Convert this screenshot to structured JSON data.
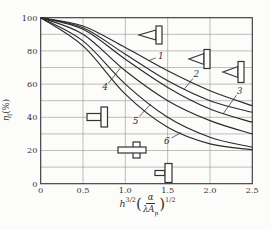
{
  "axes": {
    "y_symbol": "η",
    "y_sub": "f",
    "y_unit": "(%)",
    "x_base": "h",
    "x_base_exp": "3/2",
    "x_lparen": "(",
    "x_num": "α",
    "x_den_lambda": "λ",
    "x_den_A": "A",
    "x_den_sub": "p",
    "x_rparen": ")",
    "x_outer_exp": "1/2"
  },
  "chart_data": {
    "type": "line",
    "title": "",
    "xlabel": "h^(3/2)·(α/(λ·A_p))^(1/2)",
    "ylabel": "η_f (%)",
    "xlim": [
      0,
      2.5
    ],
    "ylim": [
      0,
      100
    ],
    "grid": "on",
    "minor_y_grid_step": 10,
    "x_ticks": [
      "0",
      "0.5",
      "1.0",
      "1.5",
      "2.0",
      "2.5"
    ],
    "x_tick_values": [
      0,
      0.5,
      1.0,
      1.5,
      2.0,
      2.5
    ],
    "y_ticks": [
      "0",
      "20",
      "40",
      "60",
      "80",
      "100"
    ],
    "y_tick_values": [
      0,
      20,
      40,
      60,
      80,
      100
    ],
    "x": [
      0,
      0.5,
      1.0,
      1.5,
      2.0,
      2.5
    ],
    "series": [
      {
        "name": "1",
        "values": [
          100,
          95,
          82,
          68,
          56,
          47
        ]
      },
      {
        "name": "2",
        "values": [
          100,
          94,
          78,
          62,
          50,
          43
        ]
      },
      {
        "name": "3",
        "values": [
          100,
          93,
          75,
          58,
          45,
          37
        ]
      },
      {
        "name": "4",
        "values": [
          100,
          90,
          68,
          50,
          38,
          30
        ]
      },
      {
        "name": "5",
        "values": [
          100,
          86,
          60,
          40,
          28,
          22
        ]
      },
      {
        "name": "6",
        "values": [
          100,
          83,
          54,
          34,
          24,
          20.5
        ]
      }
    ],
    "curve_labels": [
      {
        "text": "1",
        "x": 1.42,
        "y": 77,
        "target_x": 1.28
      },
      {
        "text": "2",
        "x": 1.84,
        "y": 66,
        "target_x": 1.7
      },
      {
        "text": "3",
        "x": 2.35,
        "y": 56,
        "target_x": 2.16
      },
      {
        "text": "4",
        "x": 0.76,
        "y": 58,
        "target_x": 0.95
      },
      {
        "text": "5",
        "x": 1.12,
        "y": 38,
        "target_x": 1.3
      },
      {
        "text": "6",
        "x": 1.49,
        "y": 26,
        "target_x": 1.66
      }
    ],
    "icons": [
      {
        "name": "triangular-spike-fin-icon-1",
        "x": 153,
        "y": 35
      },
      {
        "name": "triangular-spike-fin-icon-2",
        "x": 201,
        "y": 59
      },
      {
        "name": "triangular-spike-fin-icon-3",
        "x": 235,
        "y": 72
      },
      {
        "name": "rectangular-straight-fin-icon",
        "x": 99,
        "y": 117
      },
      {
        "name": "cruciform-fin-icon",
        "x": 132,
        "y": 150
      },
      {
        "name": "rectangular-spine-fin-icon",
        "x": 164,
        "y": 173
      }
    ],
    "colors": {
      "line": "#2b2b2b",
      "grid": "#8a8a8a",
      "axis": "#333333",
      "text": "#333333",
      "background": "#fcfcfb"
    }
  }
}
